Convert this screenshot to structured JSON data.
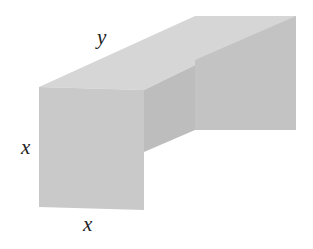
{
  "figure": {
    "labels": {
      "length": "y",
      "height": "x",
      "width": "x"
    },
    "colors": {
      "front_face": "#c9c9c9",
      "top_face": "#d6d6d6",
      "inner_side": "#bdbdbd",
      "back_wall": "#c4c4c4"
    }
  }
}
